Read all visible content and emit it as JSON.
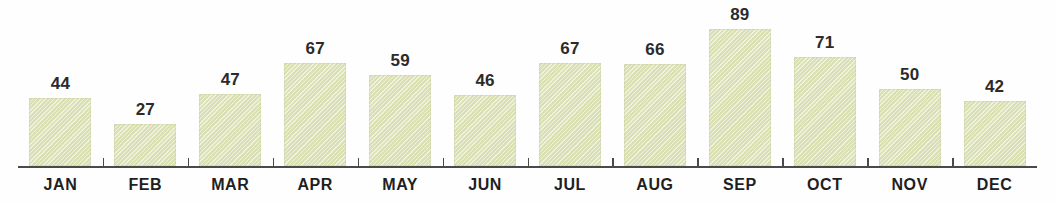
{
  "chart_data": {
    "type": "bar",
    "title": "",
    "subtitle": "",
    "xlabel": "",
    "ylabel": "",
    "categories": [
      "JAN",
      "FEB",
      "MAR",
      "APR",
      "MAY",
      "JUN",
      "JUL",
      "AUG",
      "SEP",
      "OCT",
      "NOV",
      "DEC"
    ],
    "values": [
      44,
      27,
      47,
      67,
      59,
      46,
      67,
      66,
      89,
      71,
      50,
      42
    ],
    "ylim": [
      0,
      89
    ],
    "grid": false,
    "legend": null,
    "annotations": [],
    "value_labels_shown": true,
    "axis_ticks_between_categories": true
  },
  "style": {
    "bar_fill": "#e3e8c0",
    "bar_edge": "#bec691",
    "axis_color": "#4a4a4a",
    "label_color": "#1f1f1f",
    "value_color": "#2b2b2b",
    "background": "#fefefe"
  }
}
